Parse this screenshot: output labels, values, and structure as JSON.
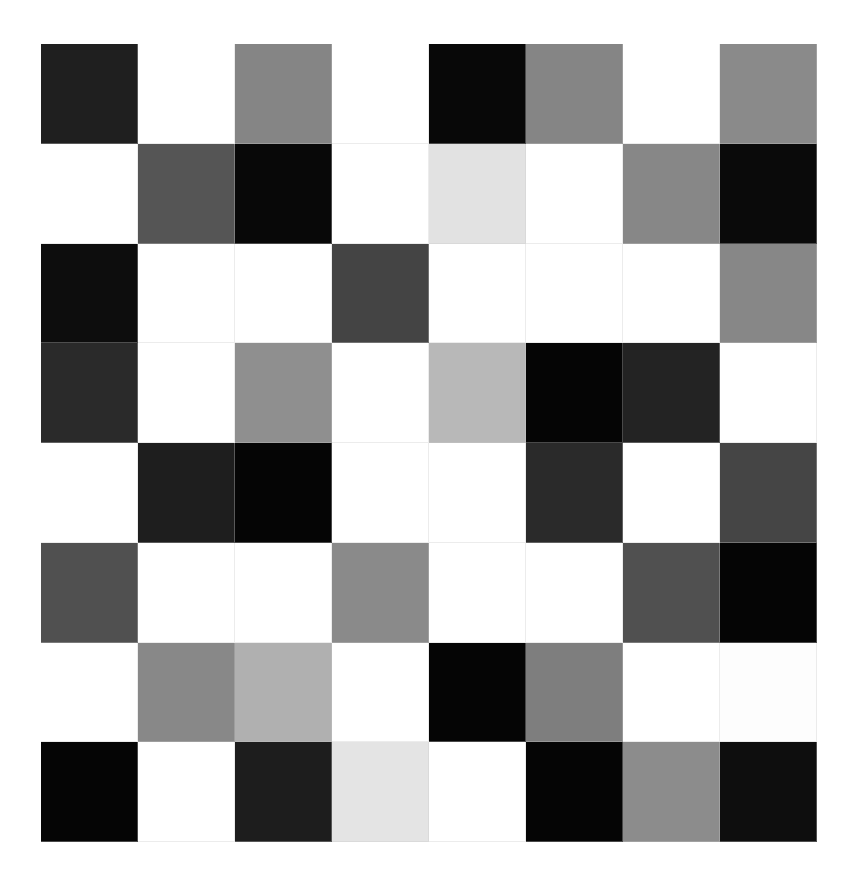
{
  "grid": {
    "rows": 8,
    "cols": 8,
    "cells": [
      [
        "#1f1f1f",
        "#ffffff",
        "#858585",
        "#ffffff",
        "#080808",
        "#858585",
        "#ffffff",
        "#8a8a8a"
      ],
      [
        "#ffffff",
        "#555555",
        "#080808",
        "#ffffff",
        "#e2e2e2",
        "#ffffff",
        "#878787",
        "#0a0a0a"
      ],
      [
        "#0d0d0d",
        "#ffffff",
        "#ffffff",
        "#444444",
        "#ffffff",
        "#ffffff",
        "#ffffff",
        "#878787"
      ],
      [
        "#2a2a2a",
        "#ffffff",
        "#8f8f8f",
        "#ffffff",
        "#b8b8b8",
        "#050505",
        "#232323",
        "#ffffff"
      ],
      [
        "#ffffff",
        "#1e1e1e",
        "#050505",
        "#ffffff",
        "#ffffff",
        "#2a2a2a",
        "#ffffff",
        "#454545"
      ],
      [
        "#505050",
        "#ffffff",
        "#ffffff",
        "#8a8a8a",
        "#ffffff",
        "#ffffff",
        "#505050",
        "#050505"
      ],
      [
        "#ffffff",
        "#888888",
        "#b0b0b0",
        "#ffffff",
        "#050505",
        "#7e7e7e",
        "#ffffff",
        "#fdfdfd"
      ],
      [
        "#050505",
        "#ffffff",
        "#1d1d1d",
        "#e4e4e4",
        "#ffffff",
        "#050505",
        "#8c8c8c",
        "#0e0e0e"
      ]
    ]
  }
}
